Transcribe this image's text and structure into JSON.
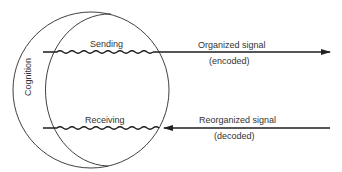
{
  "diagram": {
    "type": "communication-model",
    "region_label": "Cognition",
    "upper_channel": {
      "inner_label": "Sending",
      "outer_label": "Organized signal",
      "outer_sublabel": "(encoded)",
      "direction": "outward"
    },
    "lower_channel": {
      "inner_label": "Receiving",
      "outer_label": "Reorganized signal",
      "outer_sublabel": "(decoded)",
      "direction": "inward"
    },
    "colors": {
      "stroke": "#2a2a2a",
      "background": "#ffffff"
    }
  }
}
